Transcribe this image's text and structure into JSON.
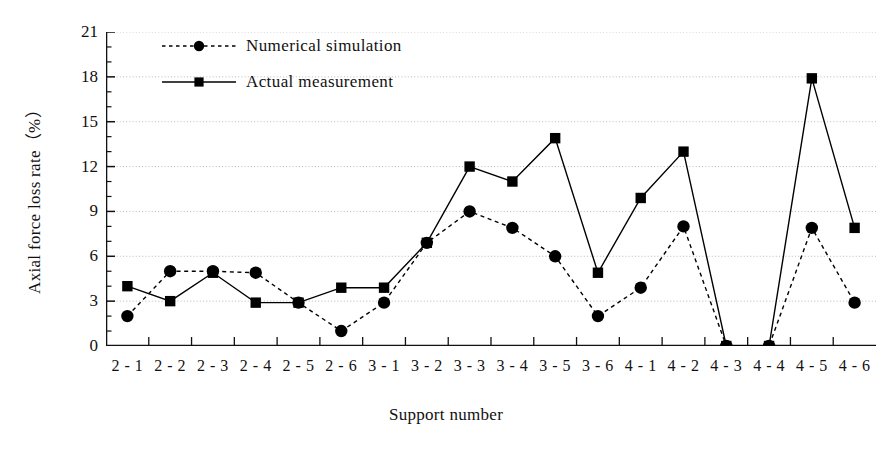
{
  "chart_data": {
    "type": "line",
    "title": "",
    "xlabel": "Support number",
    "ylabel": "Axial force loss rate（%）",
    "categories": [
      "2-1",
      "2-2",
      "2-3",
      "2-4",
      "2-5",
      "2-6",
      "3-1",
      "3-2",
      "3-3",
      "3-4",
      "3-5",
      "3-6",
      "4-1",
      "4-2",
      "4-3",
      "4-4",
      "4-5",
      "4-6"
    ],
    "yticks": [
      0,
      3,
      6,
      9,
      12,
      15,
      18,
      21
    ],
    "ylim": [
      0,
      21
    ],
    "grid": true,
    "legend_position": "upper-left-inside",
    "series": [
      {
        "name": "Numerical simulation",
        "marker": "circle",
        "linestyle": "dotted",
        "color": "#000000",
        "values": [
          2.0,
          5.0,
          5.0,
          4.9,
          2.9,
          1.0,
          2.9,
          6.9,
          9.0,
          7.9,
          6.0,
          2.0,
          3.9,
          8.0,
          0.0,
          0.0,
          7.9,
          2.9
        ]
      },
      {
        "name": "Actual measurement",
        "marker": "square",
        "linestyle": "solid",
        "color": "#000000",
        "values": [
          4.0,
          3.0,
          4.9,
          2.9,
          2.9,
          3.9,
          3.9,
          6.9,
          12.0,
          11.0,
          13.9,
          4.9,
          9.9,
          13.0,
          0.0,
          0.0,
          17.9,
          7.9
        ]
      }
    ]
  },
  "legend": {
    "items": [
      {
        "label": "Numerical simulation"
      },
      {
        "label": "Actual measurement"
      }
    ]
  }
}
